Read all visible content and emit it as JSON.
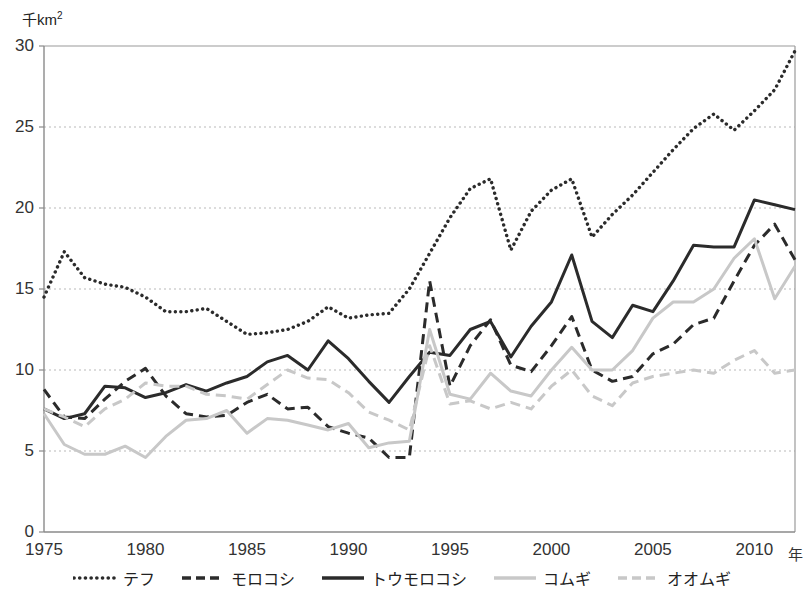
{
  "chart_data": {
    "type": "line",
    "title": "",
    "xlabel": "年",
    "ylabel": "千km²",
    "ylabel_base": "千km",
    "ylabel_sup": "2",
    "xlim": [
      1975,
      2012
    ],
    "ylim": [
      0,
      30
    ],
    "ytick_values": [
      0,
      5,
      10,
      15,
      20,
      25,
      30
    ],
    "ytick_labels": [
      "0",
      "5",
      "10",
      "15",
      "20",
      "25",
      "30"
    ],
    "xtick_values": [
      1975,
      1980,
      1985,
      1990,
      1995,
      2000,
      2005,
      2010
    ],
    "xtick_labels": [
      "1975",
      "1980",
      "1985",
      "1990",
      "1995",
      "2000",
      "2005",
      "2010"
    ],
    "grid": "horizontal-dotted",
    "legend_position": "bottom-center",
    "x": [
      1975,
      1976,
      1977,
      1978,
      1979,
      1980,
      1981,
      1982,
      1983,
      1984,
      1985,
      1986,
      1987,
      1988,
      1989,
      1990,
      1991,
      1992,
      1993,
      1994,
      1995,
      1996,
      1997,
      1998,
      1999,
      2000,
      2001,
      2002,
      2003,
      2004,
      2005,
      2006,
      2007,
      2008,
      2009,
      2010,
      2011,
      2012
    ],
    "series": [
      {
        "name": "テフ",
        "style": "dotted",
        "color": "#2b2b2b",
        "values": [
          14.5,
          17.3,
          15.7,
          15.3,
          15.1,
          14.5,
          13.6,
          13.6,
          13.8,
          13.0,
          12.2,
          12.3,
          12.5,
          13.0,
          13.9,
          13.2,
          13.4,
          13.5,
          15.0,
          17.2,
          19.4,
          21.2,
          21.8,
          17.4,
          19.8,
          21.1,
          21.8,
          18.2,
          19.6,
          20.8,
          22.2,
          23.6,
          24.9,
          25.8,
          24.8,
          26.0,
          27.3,
          29.7
        ]
      },
      {
        "name": "モロコシ",
        "style": "dashed",
        "color": "#2b2b2b",
        "values": [
          8.8,
          7.1,
          7.0,
          8.2,
          9.3,
          10.1,
          8.4,
          7.3,
          7.1,
          7.2,
          8.0,
          8.5,
          7.6,
          7.7,
          6.5,
          6.1,
          5.8,
          4.6,
          4.6,
          15.5,
          9.0,
          11.5,
          13.1,
          10.3,
          9.9,
          11.5,
          13.3,
          10.0,
          9.3,
          9.6,
          11.0,
          11.6,
          12.8,
          13.2,
          15.5,
          17.7,
          19.0,
          16.8
        ]
      },
      {
        "name": "トウモロコシ",
        "style": "solid",
        "color": "#2b2b2b",
        "values": [
          7.6,
          7.0,
          7.3,
          9.0,
          8.9,
          8.3,
          8.6,
          9.1,
          8.7,
          9.2,
          9.6,
          10.5,
          10.9,
          10.0,
          11.8,
          10.7,
          9.3,
          8.0,
          9.6,
          11.1,
          10.9,
          12.5,
          13.0,
          10.8,
          12.7,
          14.2,
          17.1,
          13.0,
          12.0,
          14.0,
          13.6,
          15.5,
          17.7,
          17.6,
          17.6,
          20.5,
          20.2,
          19.9
        ]
      },
      {
        "name": "コムギ",
        "style": "solid",
        "color": "#c8c8c8",
        "values": [
          7.3,
          5.4,
          4.8,
          4.8,
          5.3,
          4.6,
          5.9,
          6.9,
          7.0,
          7.5,
          6.1,
          7.0,
          6.9,
          6.6,
          6.3,
          6.7,
          5.2,
          5.5,
          5.6,
          12.5,
          8.5,
          8.2,
          9.8,
          8.7,
          8.4,
          10.0,
          11.4,
          10.0,
          10.0,
          11.2,
          13.2,
          14.2,
          14.2,
          15.0,
          16.9,
          18.1,
          14.4,
          16.4
        ]
      },
      {
        "name": "オオムギ",
        "style": "dashed",
        "color": "#c8c8c8",
        "values": [
          7.6,
          7.1,
          6.5,
          7.6,
          8.2,
          9.2,
          9.0,
          9.0,
          8.5,
          8.4,
          8.2,
          9.1,
          10.0,
          9.5,
          9.4,
          8.6,
          7.4,
          6.9,
          6.3,
          11.5,
          7.9,
          8.1,
          7.6,
          8.0,
          7.6,
          9.0,
          10.0,
          8.4,
          7.8,
          9.2,
          9.6,
          9.8,
          10.0,
          9.8,
          10.6,
          11.2,
          9.8,
          10.0
        ]
      }
    ]
  },
  "legend": {
    "items": [
      {
        "label": "テフ",
        "style": "dotted",
        "color": "#2b2b2b"
      },
      {
        "label": "モロコシ",
        "style": "dashed",
        "color": "#2b2b2b"
      },
      {
        "label": "トウモロコシ",
        "style": "solid",
        "color": "#2b2b2b"
      },
      {
        "label": "コムギ",
        "style": "solid",
        "color": "#c8c8c8"
      },
      {
        "label": "オオムギ",
        "style": "dashed",
        "color": "#c8c8c8"
      }
    ]
  }
}
